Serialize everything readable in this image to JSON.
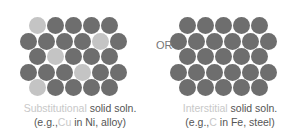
{
  "colors": {
    "host_atom": "#6e6e6e",
    "solute_atom": "#c4c4c4",
    "highlight_text": "#c8c8c8",
    "text": "#555555"
  },
  "left": {
    "origin": {
      "x": 20,
      "y": 8
    },
    "rows": [
      {
        "y": 9,
        "x0": 9,
        "count": 5,
        "light": [
          0
        ]
      },
      {
        "y": 25,
        "x0": 0,
        "count": 6,
        "light": [
          4
        ]
      },
      {
        "y": 40,
        "x0": 9,
        "count": 5,
        "light": [
          1
        ]
      },
      {
        "y": 56,
        "x0": 0,
        "count": 6,
        "light": [
          3
        ]
      },
      {
        "y": 71,
        "x0": 9,
        "count": 5,
        "light": [
          0
        ]
      }
    ],
    "caption": {
      "line1_highlight": "Substitutional",
      "line1_rest": " solid soln.",
      "line2_pre": "(e.g.,",
      "line2_highlight": "Cu",
      "line2_post": " in Ni, alloy)"
    }
  },
  "or_label": "OR",
  "right": {
    "origin": {
      "x": 170,
      "y": 8
    },
    "rows": [
      {
        "y": 9,
        "x0": 9,
        "count": 5,
        "light": []
      },
      {
        "y": 25,
        "x0": 0,
        "count": 6,
        "light": []
      },
      {
        "y": 40,
        "x0": 9,
        "count": 5,
        "light": []
      },
      {
        "y": 56,
        "x0": 0,
        "count": 6,
        "light": []
      },
      {
        "y": 71,
        "x0": 9,
        "count": 5,
        "light": []
      }
    ],
    "caption": {
      "line1_highlight": "Interstitial",
      "line1_rest": " solid soln.",
      "line2_pre": "(e.g.,",
      "line2_highlight": "C",
      "line2_post": " in Fe, steel)"
    }
  },
  "spacing": 18
}
